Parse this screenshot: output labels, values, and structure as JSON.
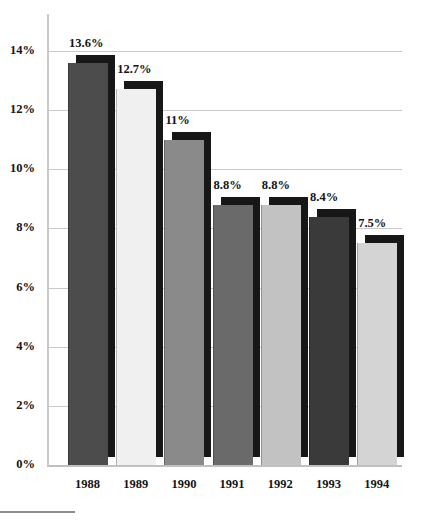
{
  "chart_data": {
    "type": "bar",
    "title": "",
    "subtitle": "",
    "xlabel": "",
    "ylabel": "",
    "categories": [
      "1988",
      "1989",
      "1990",
      "1991",
      "1992",
      "1993",
      "1994"
    ],
    "values": [
      13.6,
      12.7,
      11,
      8.8,
      8.8,
      8.4,
      7.5
    ],
    "value_labels": [
      "13.6%",
      "12.7%",
      "11%",
      "8.8%",
      "8.8%",
      "8.4%",
      "7.5%"
    ],
    "ylim": [
      0,
      14
    ],
    "ytick_values": [
      0,
      2,
      4,
      6,
      8,
      10,
      12,
      14
    ],
    "ytick_labels": [
      "0%",
      "2%",
      "4%",
      "6%",
      "8%",
      "10%",
      "12%",
      "14%"
    ],
    "grid": true,
    "legend": "none",
    "legend_entries": [],
    "annotations": [],
    "bar_colors": [
      "#4c4c4c",
      "#f0f0f0",
      "#8a8a8a",
      "#6a6a6a",
      "#c2c2c2",
      "#3a3a3a",
      "#d4d4d4"
    ],
    "bar_shadow_color": "#171717",
    "grid_color": "#c9c9c9",
    "axis_color": "#c9c9c9",
    "text_color": "#141414",
    "background_color": "#ffffff",
    "style": "3d-bar"
  },
  "footer": {
    "rule_color": "#8d8d8d"
  }
}
